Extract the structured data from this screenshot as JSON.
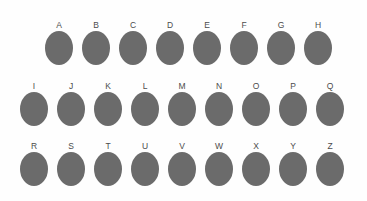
{
  "figure": {
    "background_color": "#fefefe",
    "blob_color": "#6b6b6b",
    "label_color": "#4c4c4c",
    "rows": [
      {
        "row_id": "row-1",
        "labels": [
          "A",
          "B",
          "C",
          "D",
          "E",
          "F",
          "G",
          "H"
        ]
      },
      {
        "row_id": "row-2",
        "labels": [
          "I",
          "J",
          "K",
          "L",
          "M",
          "N",
          "O",
          "P",
          "Q"
        ]
      },
      {
        "row_id": "row-3",
        "labels": [
          "R",
          "S",
          "T",
          "U",
          "V",
          "W",
          "X",
          "Y",
          "Z"
        ]
      }
    ]
  }
}
